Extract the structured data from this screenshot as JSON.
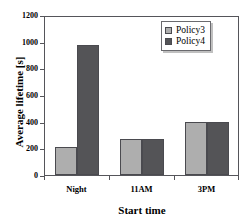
{
  "chart_data": {
    "type": "bar",
    "title": "",
    "xlabel": "Start time",
    "ylabel": "Average lifetime [s]",
    "categories": [
      "Night",
      "11AM",
      "3PM"
    ],
    "series": [
      {
        "name": "Policy3",
        "color": "#aeaeae",
        "values": [
          215,
          270,
          405
        ]
      },
      {
        "name": "Policy4",
        "color": "#545457",
        "values": [
          990,
          272,
          405
        ]
      }
    ],
    "ylim": [
      0,
      1200
    ],
    "yticks": [
      0,
      200,
      400,
      600,
      800,
      1000,
      1200
    ],
    "ytick_labels": [
      "0",
      "200",
      "400",
      "600",
      "800",
      "1000",
      "1200"
    ],
    "grid": false,
    "legend_position": "top-right",
    "frame": true
  },
  "legend": {
    "entries": [
      {
        "label": "Policy3"
      },
      {
        "label": "Policy4"
      }
    ]
  }
}
